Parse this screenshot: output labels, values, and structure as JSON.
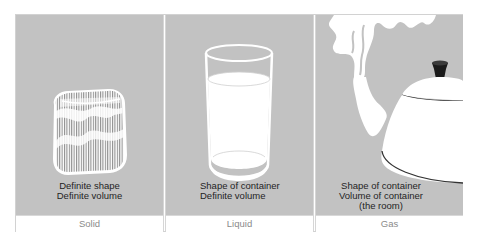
{
  "figure": {
    "panels": [
      {
        "id": "solid",
        "label": "Solid",
        "caption": [
          "Definite shape",
          "Definite volume"
        ],
        "illustration": "ice-cube-icon"
      },
      {
        "id": "liquid",
        "label": "Liquid",
        "caption": [
          "Shape of container",
          "Definite volume"
        ],
        "illustration": "water-glass-icon"
      },
      {
        "id": "gas",
        "label": "Gas",
        "caption": [
          "Shape of container",
          "Volume of container",
          "(the room)"
        ],
        "illustration": "steaming-kettle-icon"
      }
    ]
  },
  "colors": {
    "panel_background": "#c2c2c2",
    "illustration_fill": "#ffffff",
    "caption_text": "#1f1f1f",
    "footer_text": "#8a8a8a"
  }
}
